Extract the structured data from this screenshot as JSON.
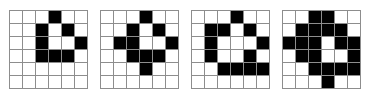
{
  "figure": {
    "name": "binary-grid-dilation-sequence",
    "panel_count": 4,
    "grid_rows": 6,
    "grid_cols": 6,
    "colors": {
      "filled": "#000000",
      "empty": "#ffffff",
      "gridline": "#8d8d8d",
      "background": "#ffffff"
    },
    "panels": [
      {
        "label": "panel-1",
        "filled_count": 9,
        "matrix": [
          [
            0,
            0,
            0,
            1,
            0,
            0
          ],
          [
            0,
            0,
            1,
            0,
            1,
            0
          ],
          [
            0,
            0,
            1,
            0,
            0,
            1
          ],
          [
            0,
            0,
            1,
            1,
            1,
            0
          ],
          [
            0,
            0,
            0,
            0,
            0,
            0
          ],
          [
            0,
            0,
            0,
            0,
            0,
            0
          ]
        ]
      },
      {
        "label": "panel-2",
        "filled_count": 12,
        "matrix": [
          [
            0,
            0,
            0,
            1,
            0,
            0
          ],
          [
            0,
            0,
            1,
            0,
            1,
            0
          ],
          [
            0,
            1,
            1,
            0,
            0,
            1
          ],
          [
            0,
            0,
            1,
            1,
            1,
            0
          ],
          [
            0,
            0,
            0,
            1,
            0,
            0
          ],
          [
            0,
            0,
            0,
            0,
            0,
            0
          ]
        ]
      },
      {
        "label": "panel-3",
        "filled_count": 14,
        "matrix": [
          [
            0,
            0,
            0,
            1,
            0,
            0
          ],
          [
            0,
            1,
            1,
            0,
            1,
            0
          ],
          [
            0,
            1,
            0,
            0,
            0,
            1
          ],
          [
            0,
            1,
            0,
            0,
            1,
            0
          ],
          [
            0,
            0,
            1,
            1,
            1,
            1
          ],
          [
            0,
            0,
            0,
            0,
            0,
            0
          ]
        ]
      },
      {
        "label": "panel-4",
        "filled_count": 24,
        "matrix": [
          [
            0,
            0,
            1,
            1,
            0,
            0
          ],
          [
            0,
            1,
            1,
            1,
            1,
            0
          ],
          [
            1,
            1,
            1,
            0,
            1,
            1
          ],
          [
            0,
            1,
            1,
            0,
            0,
            1
          ],
          [
            0,
            0,
            1,
            1,
            1,
            1
          ],
          [
            0,
            0,
            0,
            1,
            0,
            0
          ]
        ]
      }
    ]
  }
}
